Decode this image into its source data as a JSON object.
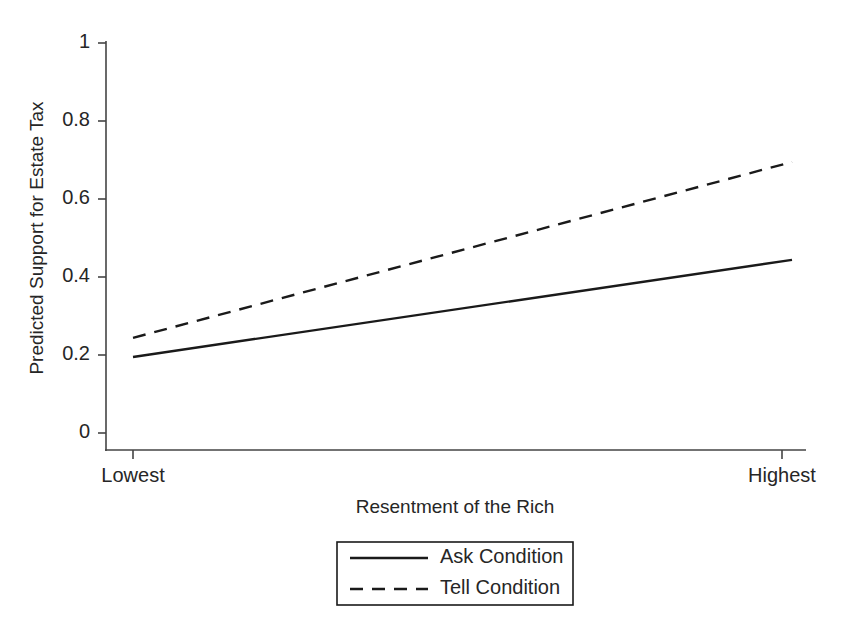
{
  "chart_data": {
    "type": "line",
    "title": "",
    "subtitle": "",
    "xlabel": "Resentment of the Rich",
    "ylabel": "Predicted Support for Estate Tax",
    "x": [
      0,
      1
    ],
    "xtick_labels": [
      "Lowest",
      "Highest"
    ],
    "xlim": [
      0,
      1
    ],
    "ylim": [
      0,
      1
    ],
    "ytick_labels": [
      "0",
      "0.2",
      "0.4",
      "0.6",
      "0.8",
      "1"
    ],
    "ytick_values": [
      0,
      0.2,
      0.4,
      0.6,
      0.8,
      1
    ],
    "grid": false,
    "legend_position": "bottom-center",
    "series": [
      {
        "name": "Ask Condition",
        "style": "solid",
        "color": "#1a1a1a",
        "values": [
          0.195,
          0.444
        ]
      },
      {
        "name": "Tell Condition",
        "style": "dashed",
        "color": "#1a1a1a",
        "values": [
          0.244,
          0.695
        ]
      }
    ]
  },
  "axes": {
    "y": {
      "ticks": [
        {
          "label": "1",
          "y": 43
        },
        {
          "label": "0.8",
          "y": 121
        },
        {
          "label": "0.6",
          "y": 199
        },
        {
          "label": "0.4",
          "y": 277
        },
        {
          "label": "0.2",
          "y": 355
        },
        {
          "label": "0",
          "y": 433
        }
      ],
      "title": "Predicted Support for Estate Tax"
    },
    "x": {
      "ticks": [
        {
          "label": "Lowest",
          "x": 133
        },
        {
          "label": "Highest",
          "x": 782
        }
      ],
      "title": "Resentment of the Rich"
    }
  },
  "legend": {
    "items": [
      {
        "label": "Ask Condition",
        "style": "solid"
      },
      {
        "label": "Tell Condition",
        "style": "dashed"
      }
    ]
  }
}
